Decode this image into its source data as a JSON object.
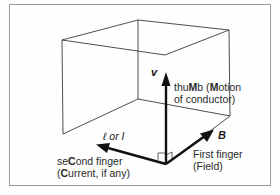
{
  "diagram": {
    "colors": {
      "line": "#3a3a3a",
      "arrow": "#111111",
      "frame": "#9a9a9a",
      "text": "#2a2a2a"
    },
    "vectors": {
      "motion": {
        "symbol": "v",
        "label_line1_pre": "thu",
        "label_line1_bold": "M",
        "label_line1_mid": "b (",
        "label_line1_bold2": "M",
        "label_line1_post": "otion",
        "label_line2": "of conductor)"
      },
      "field": {
        "symbol": "B",
        "label_line1": "First finger",
        "label_line2": "(Field)"
      },
      "current": {
        "symbol": "ℓ or I",
        "label_line1_pre": "se",
        "label_line1_bold": "C",
        "label_line1_post": "ond finger",
        "label_line2_pre": "(",
        "label_line2_bold": "C",
        "label_line2_post": "urrent, if any)"
      }
    }
  }
}
